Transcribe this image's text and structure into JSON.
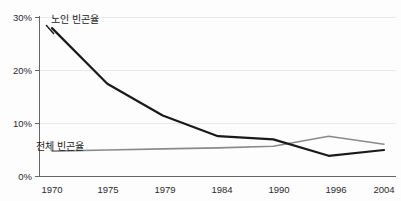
{
  "chart_data": {
    "type": "line",
    "title": "",
    "xlabel": "",
    "ylabel": "",
    "categories": [
      "1970",
      "1975",
      "1979",
      "1984",
      "1990",
      "1996",
      "2004"
    ],
    "ylim": [
      0,
      30
    ],
    "yticks": [
      0,
      10,
      20,
      30
    ],
    "ytick_labels": [
      "0%",
      "10%",
      "20%",
      "30%"
    ],
    "grid": true,
    "legend_position": "inline-labels",
    "series": [
      {
        "name": "노인 빈곤율",
        "color": "#1a1a1a",
        "values": [
          28.0,
          17.5,
          11.5,
          7.6,
          7.0,
          3.9,
          5.0
        ]
      },
      {
        "name": "전체 빈곤율",
        "color": "#8a8a8a",
        "values": [
          4.8,
          5.0,
          5.2,
          5.4,
          5.7,
          7.6,
          6.1
        ]
      }
    ],
    "annotations": [
      {
        "id": "elderly-label",
        "text": "노인 빈곤율",
        "x_px": 48,
        "y_px": 22
      },
      {
        "id": "overall-label",
        "text": "전체 빈곤율",
        "x_px": 36,
        "y_px": 148
      }
    ]
  },
  "axis": {
    "y_labels": [
      "30%",
      "20%",
      "10%",
      "0%"
    ],
    "x_labels": [
      "1970",
      "1975",
      "1979",
      "1984",
      "1990",
      "1996",
      "2004"
    ]
  },
  "labels": {
    "elderly_poverty_rate": "노인 빈곤율",
    "overall_poverty_rate": "전체 빈곤율"
  },
  "colors": {
    "elderly_line": "#1a1a1a",
    "overall_line": "#8a8a8a",
    "gridline": "#e9e9e9",
    "axis": "#666666",
    "background": "#fdfdfd"
  }
}
